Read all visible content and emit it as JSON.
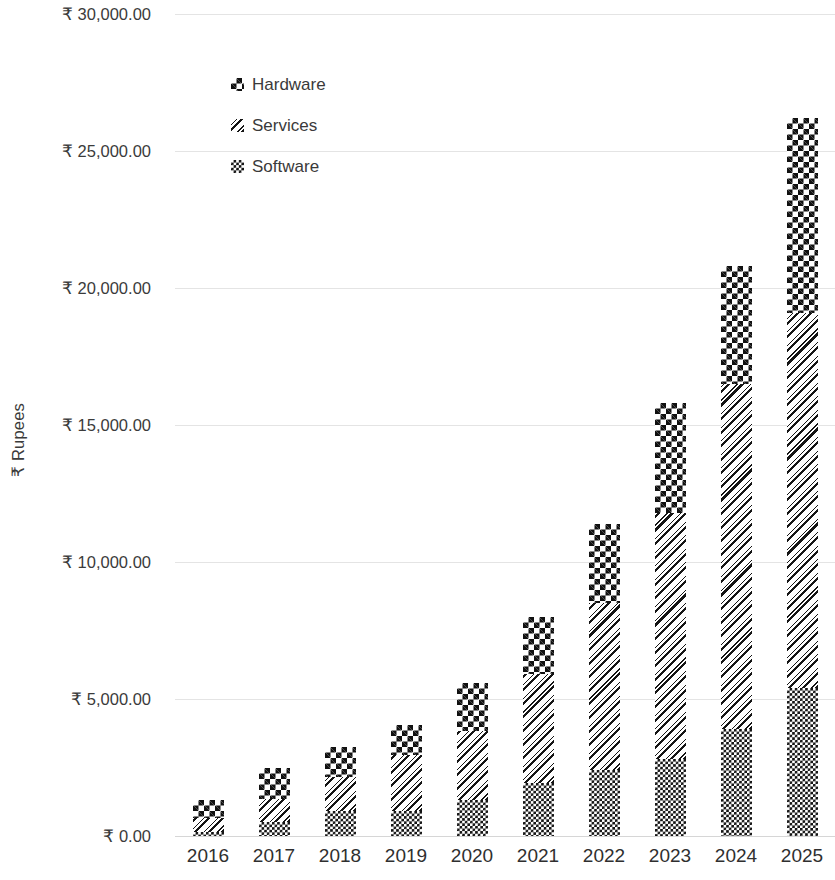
{
  "chart_data": {
    "type": "bar",
    "stacked": true,
    "title": "",
    "xlabel": "",
    "ylabel": "₹ Rupees",
    "categories": [
      "2016",
      "2017",
      "2018",
      "2019",
      "2020",
      "2021",
      "2022",
      "2023",
      "2024",
      "2025"
    ],
    "series": [
      {
        "name": "Software",
        "pattern": "fine-checkerboard",
        "values": [
          150,
          500,
          900,
          900,
          1300,
          1950,
          2400,
          2800,
          3900,
          5400
        ]
      },
      {
        "name": "Services",
        "pattern": "diagonal-hatch",
        "values": [
          500,
          850,
          1250,
          2050,
          2550,
          3950,
          6100,
          9000,
          12600,
          13700
        ]
      },
      {
        "name": "Hardware",
        "pattern": "large-checkerboard",
        "values": [
          650,
          1150,
          1100,
          1100,
          1750,
          2100,
          2900,
          4000,
          4300,
          7100
        ]
      }
    ],
    "totals": [
      1300,
      2500,
      3250,
      4050,
      5600,
      8000,
      11400,
      15800,
      20800,
      26200
    ],
    "ylim": [
      0,
      30000
    ],
    "ytick_values": [
      0,
      5000,
      10000,
      15000,
      20000,
      25000,
      30000
    ],
    "ytick_labels": [
      "₹ 0.00",
      "₹ 5,000.00",
      "₹ 10,000.00",
      "₹ 15,000.00",
      "₹ 20,000.00",
      "₹ 25,000.00",
      "₹ 30,000.00"
    ],
    "grid": true,
    "grid_color": "#e4e4e4",
    "legend_position": "top-left-inside",
    "legend_entries": [
      "Hardware",
      "Services",
      "Software"
    ],
    "bar_color": "#111111",
    "background_color": "#ffffff",
    "currency_symbol": "₹"
  }
}
